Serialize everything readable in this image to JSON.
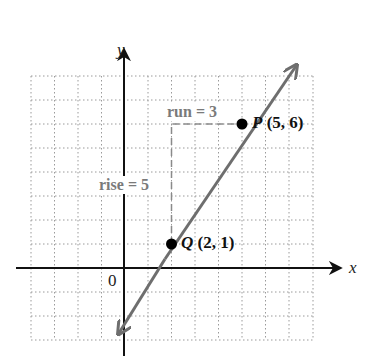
{
  "diagram": {
    "axes": {
      "x_label": "x",
      "y_label": "y",
      "origin_label": "0"
    },
    "grid": {
      "x_min": -4,
      "x_max": 8,
      "y_min": -3,
      "y_max": 8,
      "style": "dotted"
    },
    "points": [
      {
        "name": "Q",
        "coords": "(2, 1)",
        "x": 2,
        "y": 1
      },
      {
        "name": "P",
        "coords": "(5, 6)",
        "x": 5,
        "y": 6
      }
    ],
    "annotations": {
      "run": "run = 3",
      "rise": "rise = 5"
    },
    "line_color": "#6e6e6e",
    "dash_color": "#8a8a8a"
  }
}
